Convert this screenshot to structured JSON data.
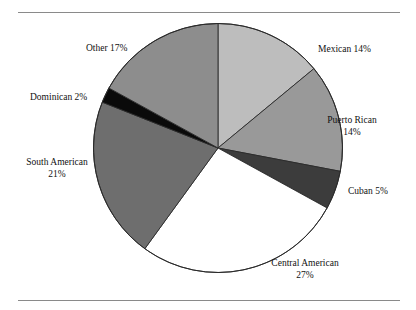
{
  "figure": {
    "caption_partial": "",
    "frame_color": "#8a8a8a"
  },
  "chart_data": {
    "type": "pie",
    "title": "",
    "xlabel": "",
    "ylabel": "",
    "legend_position": "none",
    "grid": false,
    "start_angle_deg": 0,
    "direction": "clockwise",
    "categories": [
      "Mexican",
      "Puerto Rican",
      "Cuban",
      "Central American",
      "South American",
      "Dominican",
      "Other"
    ],
    "values": [
      14,
      14,
      5,
      27,
      21,
      2,
      17
    ],
    "value_unit": "%",
    "colors": [
      "#bdbdbd",
      "#999999",
      "#3c3c3c",
      "#ffffff",
      "#6e6e6e",
      "#0a0a0a",
      "#8d8d8d"
    ],
    "slices": [
      {
        "label": "Mexican",
        "value": 14,
        "display": "Mexican 14%",
        "color": "#bdbdbd"
      },
      {
        "label": "Puerto Rican",
        "value": 14,
        "display": "Puerto Rican 14%",
        "color": "#999999"
      },
      {
        "label": "Cuban",
        "value": 5,
        "display": "Cuban 5%",
        "color": "#3c3c3c"
      },
      {
        "label": "Central American",
        "value": 27,
        "display": "Central American 27%",
        "color": "#ffffff"
      },
      {
        "label": "South American",
        "value": 21,
        "display": "South American 21%",
        "color": "#6e6e6e"
      },
      {
        "label": "Dominican",
        "value": 2,
        "display": "Dominican 2%",
        "color": "#0a0a0a"
      },
      {
        "label": "Other",
        "value": 17,
        "display": "Other 17%",
        "color": "#8d8d8d"
      }
    ],
    "labels": {
      "mexican": {
        "line1": "Mexican 14%"
      },
      "puerto_rican": {
        "line1": "Puerto Rican",
        "line2": "14%"
      },
      "cuban": {
        "line1": "Cuban 5%"
      },
      "central_american": {
        "line1": "Central American",
        "line2": "27%"
      },
      "south_american": {
        "line1": "South American",
        "line2": "21%"
      },
      "dominican": {
        "line1": "Dominican 2%"
      },
      "other": {
        "line1": "Other 17%"
      }
    }
  }
}
